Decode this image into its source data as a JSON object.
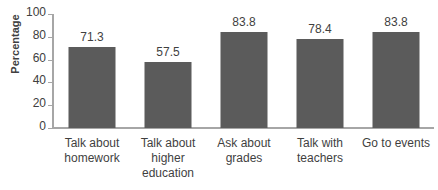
{
  "chart_data": {
    "type": "bar",
    "title": "",
    "xlabel": "",
    "ylabel": "Percentage",
    "ylim": [
      0,
      100
    ],
    "yticks": [
      0,
      20,
      40,
      60,
      80,
      100
    ],
    "grid": false,
    "legend": null,
    "bar_color": "#5b5b5b",
    "axis_color": "#a6a6a6",
    "text_color": "#3f3f3f",
    "categories": [
      "Talk about homework",
      "Talk about higher education",
      "Ask about grades",
      "Talk with teachers",
      "Go to events"
    ],
    "category_lines": [
      [
        "Talk about",
        "homework"
      ],
      [
        "Talk about",
        "higher",
        "education"
      ],
      [
        "Ask about",
        "grades"
      ],
      [
        "Talk with",
        "teachers"
      ],
      [
        "Go to events"
      ]
    ],
    "values": [
      71.3,
      57.5,
      83.8,
      78.4,
      83.8
    ],
    "value_labels": [
      "71.3",
      "57.5",
      "83.8",
      "78.4",
      "83.8"
    ]
  }
}
